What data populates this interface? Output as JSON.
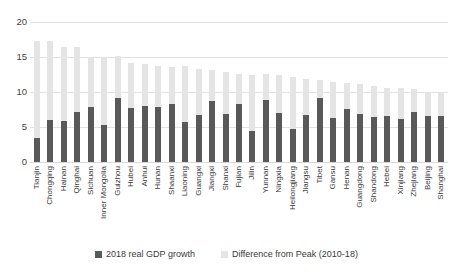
{
  "chart_data": {
    "type": "bar",
    "subtype": "stacked-column",
    "title": "",
    "subtitle": "",
    "xlabel": "",
    "ylabel": "",
    "ylim": [
      0,
      20
    ],
    "yticks": [
      0,
      5,
      10,
      15,
      20
    ],
    "grid": true,
    "legend_position": "bottom",
    "colors": {
      "growth": "#595959",
      "difference": "#e4e4e4",
      "gridline": "#e2e2e2",
      "text": "#3a3a3a"
    },
    "categories": [
      "Tianjin",
      "Chongqing",
      "Hainan",
      "Qinghai",
      "Sichuan",
      "Inner Mongolia",
      "Guizhou",
      "Hubei",
      "Anhui",
      "Hunan",
      "Shaanxi",
      "Liaoning",
      "Guangxi",
      "Jiangxi",
      "Shanxi",
      "Fujian",
      "Jilin",
      "Yunnan",
      "Ningxia",
      "Heilongjiang",
      "Jiangsu",
      "Tibet",
      "Gansu",
      "Henan",
      "Guangdong",
      "Shandong",
      "Hebei",
      "Xinjiang",
      "Zhejiang",
      "Beijing",
      "Shanghai"
    ],
    "series": [
      {
        "name": "2018 real GDP growth",
        "color": "#595959",
        "values": [
          3.4,
          6.0,
          5.8,
          7.2,
          7.8,
          5.3,
          9.1,
          7.7,
          8.0,
          7.8,
          8.3,
          5.7,
          6.7,
          8.7,
          6.9,
          8.3,
          4.5,
          8.8,
          7.0,
          4.7,
          6.7,
          9.1,
          6.3,
          7.6,
          6.8,
          6.4,
          6.6,
          6.1,
          7.1,
          6.6,
          6.6
        ]
      },
      {
        "name": "Difference from Peak (2010-18)",
        "color": "#e4e4e4",
        "values": [
          13.9,
          11.3,
          10.6,
          9.2,
          7.2,
          9.7,
          6.0,
          6.4,
          6.0,
          5.9,
          5.3,
          8.0,
          6.6,
          4.5,
          6.0,
          4.3,
          8.0,
          3.8,
          5.4,
          7.4,
          5.1,
          2.6,
          5.2,
          3.7,
          4.3,
          4.4,
          4.0,
          4.5,
          3.3,
          3.4,
          3.4
        ]
      }
    ],
    "totals": [
      17.3,
      17.3,
      16.4,
      16.4,
      15.0,
      15.0,
      15.1,
      14.1,
      14.0,
      13.7,
      13.6,
      13.7,
      13.3,
      13.2,
      12.9,
      12.6,
      12.5,
      12.6,
      12.4,
      12.1,
      11.8,
      11.7,
      11.5,
      11.3,
      11.1,
      10.8,
      10.6,
      10.6,
      10.4,
      10.0,
      10.0
    ]
  },
  "legend": {
    "entries": [
      {
        "label": "2018 real GDP growth",
        "color": "#595959"
      },
      {
        "label": "Difference from Peak (2010-18)",
        "color": "#e4e4e4"
      }
    ]
  },
  "y_axis": {
    "ticks": [
      "20",
      "15",
      "10",
      "5",
      "0"
    ]
  }
}
